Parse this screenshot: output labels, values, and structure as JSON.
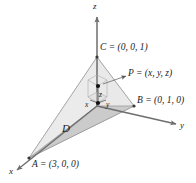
{
  "figure": {
    "type": "3d-coordinate-diagram",
    "background": "#ffffff",
    "axes": {
      "x_label": "x",
      "y_label": "y",
      "z_label": "z"
    },
    "points": [
      {
        "name": "A",
        "label": "A = (3, 0, 0)",
        "coords": [
          3,
          0,
          0
        ]
      },
      {
        "name": "B",
        "label": "B = (0, 1, 0)",
        "coords": [
          0,
          1,
          0
        ]
      },
      {
        "name": "C",
        "label": "C = (0, 0, 1)",
        "coords": [
          0,
          0,
          1
        ]
      },
      {
        "name": "P",
        "label": "P = (x, y, z)",
        "coords": [
          "x",
          "y",
          "z"
        ]
      }
    ],
    "region_label": "D",
    "coordinate_labels": {
      "x": "x",
      "y": "y",
      "z": "z"
    },
    "colors": {
      "line": "#6e6e6e",
      "fill_front": "#c9c9c9",
      "fill_back": "#ededed",
      "dot": "#111111",
      "text": "#1a1a1a"
    }
  }
}
